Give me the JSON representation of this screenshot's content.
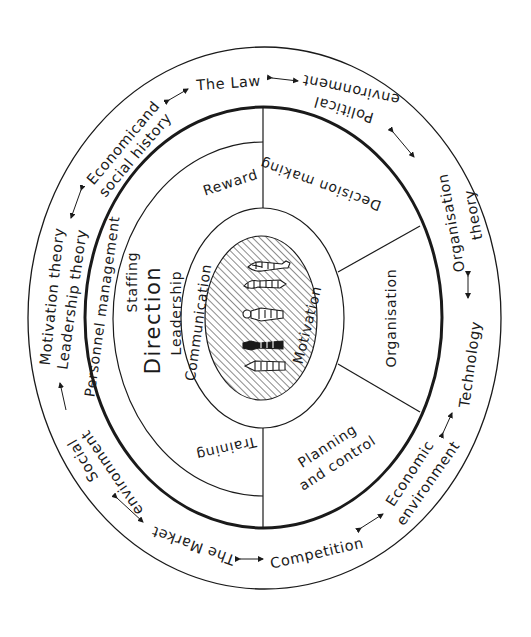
{
  "diagram": {
    "outer_ring": {
      "labels": {
        "the_law": "The Law",
        "political_1": "Political",
        "political_2": "environment",
        "org_theory_1": "Organisation",
        "org_theory_2": "theory",
        "technology": "Technology",
        "economic_env_1": "Economic",
        "economic_env_2": "environment",
        "competition": "Competition",
        "the_market": "The Market",
        "social_env_1": "Social",
        "social_env_2": "environment",
        "motivation_theory": "Motivation theory",
        "leadership_theory": "Leadership theory",
        "econ_social_1": "Economicand",
        "econ_social_2": "social history"
      }
    },
    "inner_ring": {
      "left_band": "Personnel management",
      "segments": {
        "reward": "Reward",
        "staffing": "Staffing",
        "direction": "Direction",
        "leadership": "Leadership",
        "training": "Training",
        "decision_making": "Decision making",
        "organisation": "Organisation",
        "planning_1": "Planning",
        "planning_2": "and control"
      }
    },
    "core": {
      "communication": "Communication",
      "motivation": "Motivation",
      "figures_count": 5
    },
    "colors": {
      "ink": "#1a1a1a",
      "background": "#ffffff"
    }
  }
}
